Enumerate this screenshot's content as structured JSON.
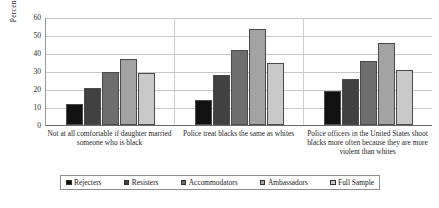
{
  "chart_data": {
    "type": "bar",
    "title": "",
    "xlabel": "",
    "ylabel": "Percent",
    "ylim": [
      0,
      60
    ],
    "yticks": [
      0,
      10,
      20,
      30,
      40,
      50,
      60
    ],
    "grid": true,
    "legend_position": "bottom",
    "categories": [
      "Not at all comfortable if daughter married someone who is black",
      "Police treat blacks the same as whites",
      "Police officers in the United States shoot blacks more often because they are more violent than whites"
    ],
    "series": [
      {
        "name": "Rejecters",
        "color": "#111111",
        "values": [
          12,
          14,
          19
        ]
      },
      {
        "name": "Resisters",
        "color": "#414141",
        "values": [
          21,
          28,
          26
        ]
      },
      {
        "name": "Accommodators",
        "color": "#6e6e6e",
        "values": [
          30,
          42,
          36
        ]
      },
      {
        "name": "Ambassadors",
        "color": "#a3a3a3",
        "values": [
          37,
          54,
          46
        ]
      },
      {
        "name": "Full Sample",
        "color": "#c9c9c9",
        "values": [
          29,
          35,
          31
        ]
      }
    ]
  },
  "caption": ""
}
